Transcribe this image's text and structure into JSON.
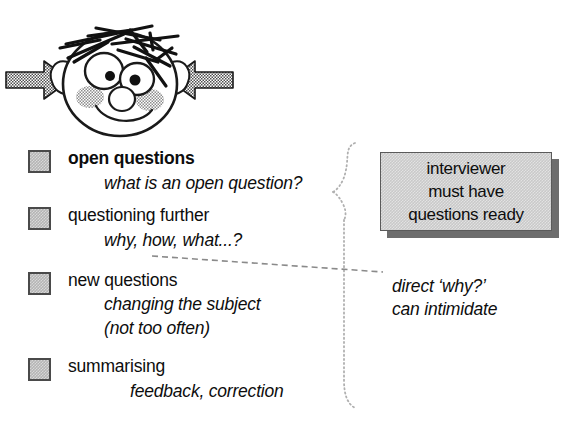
{
  "illustration": {
    "name": "cartoon-face-with-arrows",
    "description": "cartoon face with spiky hair, big eyes, blushed cheeks, squeezed by two arrows",
    "left_arrow": "arrow-pointing-right",
    "right_arrow": "arrow-pointing-left",
    "colors": {
      "outline": "#111111",
      "arrow_fill": "#808080",
      "cheek_fill": "#9a9a9a"
    }
  },
  "list": {
    "items": [
      {
        "marker": "grey-square-bullet",
        "title": "open questions",
        "bold": true,
        "subs": [
          "what is an open question?"
        ]
      },
      {
        "marker": "grey-square-bullet",
        "title": "questioning further",
        "bold": false,
        "subs": [
          "why, how, what...?"
        ]
      },
      {
        "marker": "grey-square-bullet",
        "title": "new questions",
        "bold": false,
        "subs": [
          "changing the subject",
          "(not too often)"
        ]
      },
      {
        "marker": "grey-square-bullet",
        "title": "summarising",
        "bold": false,
        "subs": [
          "feedback, correction"
        ]
      }
    ]
  },
  "brace": {
    "name": "dotted-curly-brace",
    "style": "dotted",
    "color": "#b0b0b0"
  },
  "leader": {
    "name": "dashed-leader-line",
    "style": "dashed",
    "color": "#8a8a8a"
  },
  "callout": {
    "lines": [
      "interviewer",
      "must have",
      "questions ready"
    ],
    "fill": "#c9c9c9",
    "shadow": "#6d6d6d"
  },
  "side_note": {
    "lines": [
      "direct ‘why?’",
      "can intimidate"
    ]
  }
}
